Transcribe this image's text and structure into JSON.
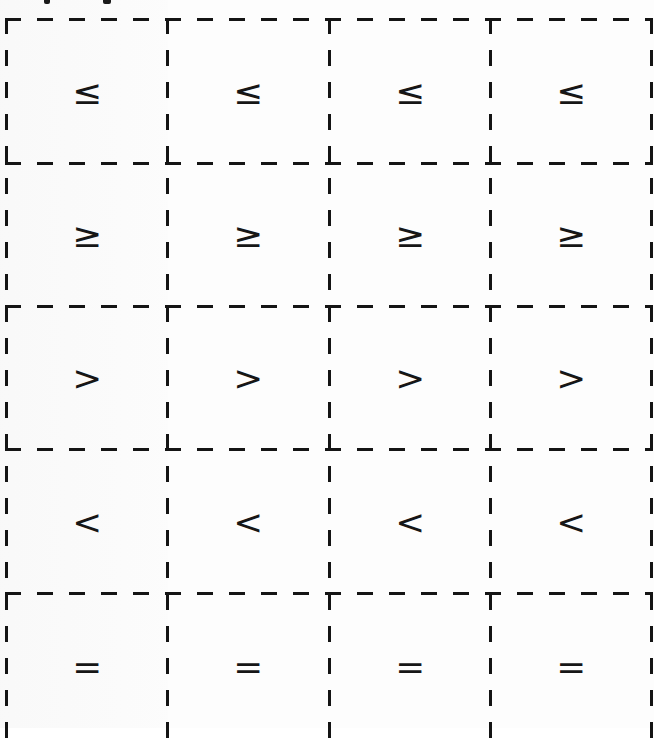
{
  "heading": {
    "visible_text": ""
  },
  "worksheet": {
    "columns": 4,
    "rows": [
      {
        "symbols": [
          "≤",
          "≤",
          "≤",
          "≤"
        ]
      },
      {
        "symbols": [
          "≥",
          "≥",
          "≥",
          "≥"
        ]
      },
      {
        "symbols": [
          ">",
          ">",
          ">",
          ">"
        ]
      },
      {
        "symbols": [
          "<",
          "<",
          "<",
          "<"
        ]
      },
      {
        "symbols": [
          "=",
          "=",
          "=",
          "="
        ]
      }
    ]
  },
  "colors": {
    "ink": "#141414",
    "paper": "#fdfdfd"
  }
}
